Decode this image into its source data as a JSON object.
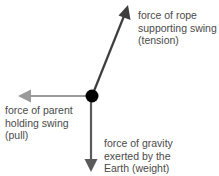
{
  "diagram": {
    "colors": {
      "tension": "#3d3d3d",
      "pull": "#9a9a9a",
      "weight": "#5a5a5a",
      "object": "#000000",
      "text": "#4a4a4a"
    },
    "object": {
      "label": "swing",
      "x": 92,
      "y": 96,
      "r": 6.5
    },
    "forces": [
      {
        "id": "tension",
        "lines": [
          "force of rope",
          "supporting swing",
          "(tension)"
        ],
        "direction": "up-right"
      },
      {
        "id": "pull",
        "lines": [
          "force of parent",
          "holding swing",
          "(pull)"
        ],
        "direction": "left"
      },
      {
        "id": "weight",
        "lines": [
          "force of gravity",
          "exerted by the",
          "Earth (weight)"
        ],
        "direction": "down"
      }
    ]
  }
}
